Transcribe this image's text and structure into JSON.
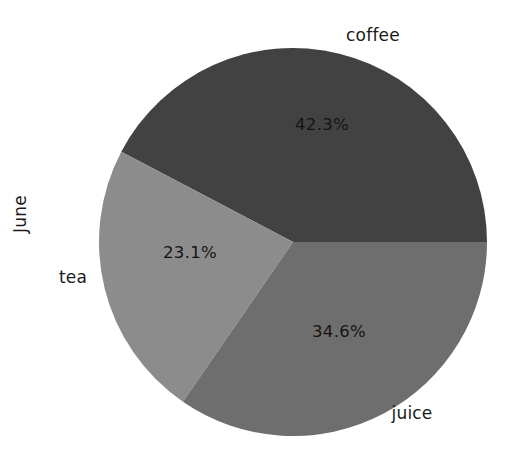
{
  "figure": {
    "width": 514,
    "height": 450,
    "background": "#ffffff"
  },
  "ylabel": "June",
  "chart_data": {
    "type": "pie",
    "title": "",
    "ylabel": "June",
    "xlabel": "",
    "legend": "none",
    "grid": false,
    "startangle": 0,
    "direction": "counterclockwise",
    "categories": [
      "coffee",
      "juice",
      "tea"
    ],
    "values": [
      42.3,
      34.6,
      23.1
    ],
    "labels": [
      "coffee",
      "juice",
      "tea"
    ],
    "autopct_labels": [
      "42.3%",
      "34.6%",
      "23.1%"
    ],
    "colors": [
      "#424242",
      "#6e6e6e",
      "#8c8c8c"
    ],
    "slices": [
      {
        "name": "coffee",
        "label": "coffee",
        "pct_text": "42.3%",
        "value": 42.3,
        "color": "#424242",
        "start_deg": 0,
        "end_deg": 152.28,
        "label_x": 373,
        "label_y": 35,
        "pct_x": 322,
        "pct_y": 124
      },
      {
        "name": "tea",
        "label": "tea",
        "pct_text": "23.1%",
        "value": 23.1,
        "color": "#8c8c8c",
        "start_deg": 152.28,
        "end_deg": 235.44,
        "label_x": 73,
        "label_y": 277,
        "pct_x": 190,
        "pct_y": 252
      },
      {
        "name": "juice",
        "label": "juice",
        "pct_text": "34.6%",
        "value": 34.6,
        "color": "#6e6e6e",
        "start_deg": 235.44,
        "end_deg": 360,
        "label_x": 412,
        "label_y": 413,
        "pct_x": 339,
        "pct_y": 331
      }
    ]
  }
}
